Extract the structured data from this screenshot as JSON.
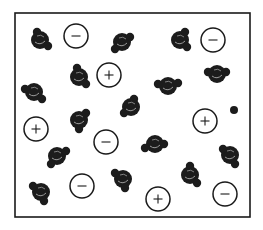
{
  "diagram": {
    "container": {
      "x": 15,
      "y": 13,
      "width": 235,
      "height": 204,
      "stroke": "#1a1a1a"
    },
    "colors": {
      "molecule": "#1c1c1c",
      "highlight": "#9a9a9a",
      "ion_stroke": "#1a1a1a",
      "ion_fill": "#ffffff"
    },
    "molecules": [
      {
        "x": 40,
        "y": 40,
        "h": [
          [
            -3,
            -8
          ],
          [
            8,
            6
          ]
        ]
      },
      {
        "x": 122,
        "y": 42,
        "h": [
          [
            8,
            -5
          ],
          [
            -7,
            7
          ]
        ]
      },
      {
        "x": 180,
        "y": 40,
        "h": [
          [
            5,
            -8
          ],
          [
            7,
            7
          ]
        ]
      },
      {
        "x": 34,
        "y": 92,
        "h": [
          [
            -9,
            -3
          ],
          [
            8,
            7
          ]
        ]
      },
      {
        "x": 79,
        "y": 77,
        "h": [
          [
            -2,
            -9
          ],
          [
            7,
            7
          ]
        ]
      },
      {
        "x": 168,
        "y": 86,
        "h": [
          [
            -10,
            -2
          ],
          [
            10,
            -3
          ]
        ]
      },
      {
        "x": 217,
        "y": 74,
        "h": [
          [
            -9,
            -2
          ],
          [
            9,
            -2
          ]
        ]
      },
      {
        "x": 131,
        "y": 107,
        "h": [
          [
            3,
            -8
          ],
          [
            -7,
            6
          ]
        ]
      },
      {
        "x": 79,
        "y": 120,
        "h": [
          [
            7,
            -7
          ],
          [
            0,
            9
          ]
        ]
      },
      {
        "x": 155,
        "y": 144,
        "h": [
          [
            -10,
            4
          ],
          [
            9,
            0
          ]
        ]
      },
      {
        "x": 230,
        "y": 155,
        "h": [
          [
            -7,
            -6
          ],
          [
            5,
            9
          ]
        ]
      },
      {
        "x": 57,
        "y": 156,
        "h": [
          [
            9,
            -5
          ],
          [
            -6,
            8
          ]
        ]
      },
      {
        "x": 123,
        "y": 179,
        "h": [
          [
            -8,
            -6
          ],
          [
            2,
            9
          ]
        ]
      },
      {
        "x": 190,
        "y": 175,
        "h": [
          [
            0,
            -9
          ],
          [
            7,
            8
          ]
        ]
      },
      {
        "x": 41,
        "y": 192,
        "h": [
          [
            -8,
            -6
          ],
          [
            3,
            9
          ]
        ]
      }
    ],
    "ions": [
      {
        "x": 76,
        "y": 36,
        "r": 12,
        "charge": "−",
        "type": "negative"
      },
      {
        "x": 213,
        "y": 40,
        "r": 12,
        "charge": "−",
        "type": "negative"
      },
      {
        "x": 109,
        "y": 75,
        "r": 12,
        "charge": "+",
        "type": "positive"
      },
      {
        "x": 36,
        "y": 129,
        "r": 12,
        "charge": "+",
        "type": "positive"
      },
      {
        "x": 106,
        "y": 142,
        "r": 12,
        "charge": "−",
        "type": "negative"
      },
      {
        "x": 205,
        "y": 121,
        "r": 12,
        "charge": "+",
        "type": "positive"
      },
      {
        "x": 82,
        "y": 186,
        "r": 12,
        "charge": "−",
        "type": "negative"
      },
      {
        "x": 158,
        "y": 199,
        "r": 12,
        "charge": "+",
        "type": "positive"
      },
      {
        "x": 225,
        "y": 194,
        "r": 12,
        "charge": "−",
        "type": "negative"
      }
    ],
    "particles": [
      {
        "x": 234,
        "y": 110,
        "r": 4
      }
    ]
  }
}
